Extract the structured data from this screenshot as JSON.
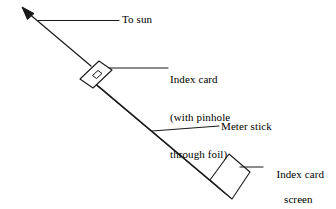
{
  "figure": {
    "stroke_color": "#1a1a1a",
    "fill_color": "#ffffff",
    "background_color": "#ffffff"
  },
  "labels": {
    "to_sun": "To sun",
    "index_card_line1": "Index card",
    "index_card_line2": "(with pinhole",
    "index_card_line3": "through foil)",
    "meter_stick": "Meter stick",
    "screen_line1": "Index card",
    "screen_line2": "screen"
  },
  "parts": {
    "sun_ray_arrow": "sun-ray-arrow",
    "pinhole_card": "pinhole-index-card",
    "pinhole_aperture": "pinhole-aperture",
    "meter_stick": "meter-stick",
    "screen_card": "index-card-screen"
  },
  "leader_lines": {
    "to_sun": "leader-to-sun",
    "index_card": "leader-index-card",
    "meter_stick": "leader-meter-stick",
    "screen": "leader-screen"
  }
}
